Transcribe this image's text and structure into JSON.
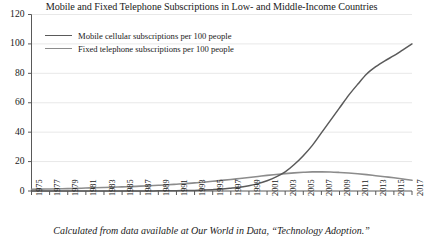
{
  "chart_data": {
    "type": "line",
    "title": "Mobile and Fixed Telephone Subscriptions in Low- and Middle-Income Countries",
    "xlabel": "",
    "ylabel": "",
    "xlim": [
      1975,
      2017
    ],
    "ylim": [
      0,
      120
    ],
    "grid": true,
    "legend_position": "top-left",
    "caption": "Calculated from data available at Our World in Data, “Technology Adoption.”",
    "ytick_labels": [
      "0",
      "20",
      "40",
      "60",
      "80",
      "100",
      "120"
    ],
    "ytick_values": [
      0,
      20,
      40,
      60,
      80,
      100,
      120
    ],
    "xtick_labels": [
      "1975",
      "1977",
      "1979",
      "1981",
      "1983",
      "1985",
      "1987",
      "1989",
      "1991",
      "1993",
      "1995",
      "1997",
      "1999",
      "2001",
      "2003",
      "2005",
      "2007",
      "2009",
      "2011",
      "2013",
      "2015",
      "2017"
    ],
    "xtick_values": [
      1975,
      1977,
      1979,
      1981,
      1983,
      1985,
      1987,
      1989,
      1991,
      1993,
      1995,
      1997,
      1999,
      2001,
      2003,
      2005,
      2007,
      2009,
      2011,
      2013,
      2015,
      2017
    ],
    "x": [
      1975,
      1976,
      1977,
      1978,
      1979,
      1980,
      1981,
      1982,
      1983,
      1984,
      1985,
      1986,
      1987,
      1988,
      1989,
      1990,
      1991,
      1992,
      1993,
      1994,
      1995,
      1996,
      1997,
      1998,
      1999,
      2000,
      2001,
      2002,
      2003,
      2004,
      2005,
      2006,
      2007,
      2008,
      2009,
      2010,
      2011,
      2012,
      2013,
      2014,
      2015,
      2016,
      2017
    ],
    "series": [
      {
        "name": "Mobile cellular subscriptions per 100 people",
        "color": "#5a5a5a",
        "values": [
          0,
          0,
          0,
          0,
          0,
          0,
          0,
          0,
          0,
          0,
          0,
          0,
          0,
          0.05,
          0.1,
          0.15,
          0.2,
          0.3,
          0.4,
          0.6,
          0.9,
          1.3,
          1.9,
          2.6,
          3.6,
          5.0,
          7.0,
          9.6,
          13.0,
          18.0,
          24.0,
          31.0,
          39.5,
          48.0,
          56.5,
          65.0,
          72.5,
          79.5,
          84.5,
          88.5,
          92.0,
          96.0,
          100.0
        ]
      },
      {
        "name": "Fixed telephone subscriptions per 100 people",
        "color": "#8c8c8c",
        "values": [
          1.2,
          1.3,
          1.4,
          1.5,
          1.6,
          1.8,
          2.0,
          2.2,
          2.4,
          2.6,
          2.8,
          3.0,
          3.3,
          3.6,
          3.9,
          4.2,
          4.6,
          5.0,
          5.5,
          6.0,
          6.6,
          7.2,
          7.8,
          8.5,
          9.2,
          9.9,
          10.6,
          11.2,
          11.8,
          12.3,
          12.7,
          13.0,
          13.0,
          12.9,
          12.6,
          12.2,
          11.7,
          11.1,
          10.4,
          9.7,
          9.0,
          8.2,
          7.3
        ]
      }
    ]
  },
  "axis": {
    "line_color": "#595959",
    "grid_color": "#e8e8e8"
  }
}
